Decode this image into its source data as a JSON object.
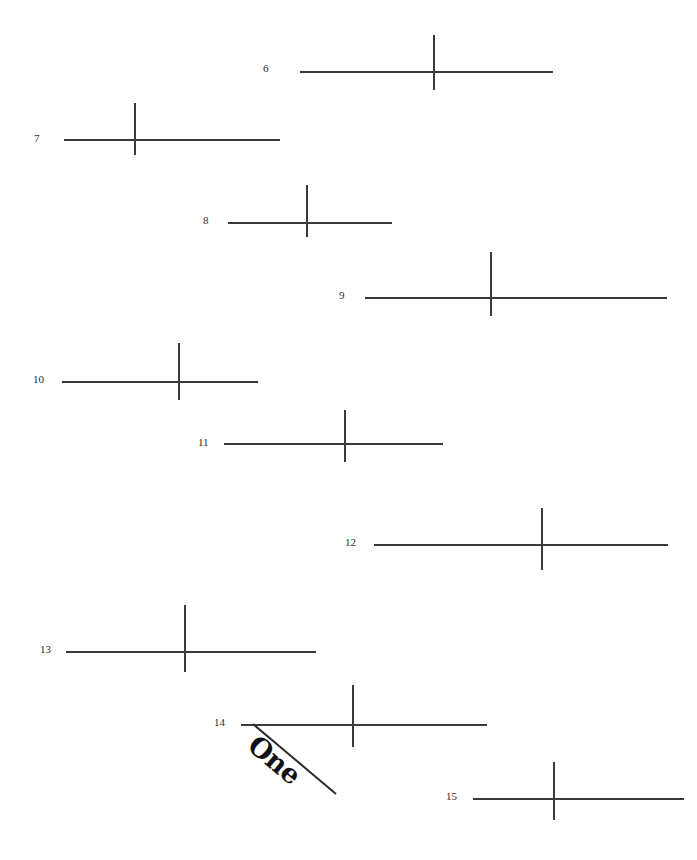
{
  "page": {
    "width": 697,
    "height": 860,
    "background_color": "#ffffff",
    "ink_color": "#3a3a3a",
    "label_color": "#2b2b2b"
  },
  "annotation": {
    "text": "One",
    "rotation_deg": 40,
    "x": 262,
    "y": 729,
    "color": "#111111"
  },
  "diagonal": {
    "x1": 253,
    "y1": 724,
    "x2": 336,
    "y2": 794,
    "color": "#2b2b2b",
    "width": 2
  },
  "crosses": [
    {
      "label": "6",
      "label_x": 263,
      "label_y": 63,
      "h_x": 300,
      "h_y": 71,
      "h_w": 253,
      "v_x": 433,
      "v_y": 35,
      "v_h": 55
    },
    {
      "label": "7",
      "label_x": 34,
      "label_y": 133,
      "h_x": 64,
      "h_y": 139,
      "h_w": 216,
      "v_x": 134,
      "v_y": 103,
      "v_h": 52
    },
    {
      "label": "8",
      "label_x": 203,
      "label_y": 215,
      "h_x": 228,
      "h_y": 222,
      "h_w": 164,
      "v_x": 306,
      "v_y": 185,
      "v_h": 52
    },
    {
      "label": "9",
      "label_x": 339,
      "label_y": 290,
      "h_x": 365,
      "h_y": 297,
      "h_w": 302,
      "v_x": 490,
      "v_y": 252,
      "v_h": 64
    },
    {
      "label": "10",
      "label_x": 33,
      "label_y": 374,
      "h_x": 62,
      "h_y": 381,
      "h_w": 196,
      "v_x": 178,
      "v_y": 343,
      "v_h": 57
    },
    {
      "label": "11",
      "label_x": 198,
      "label_y": 437,
      "h_x": 224,
      "h_y": 443,
      "h_w": 219,
      "v_x": 344,
      "v_y": 410,
      "v_h": 52
    },
    {
      "label": "12",
      "label_x": 345,
      "label_y": 537,
      "h_x": 374,
      "h_y": 544,
      "h_w": 294,
      "v_x": 541,
      "v_y": 508,
      "v_h": 62
    },
    {
      "label": "13",
      "label_x": 40,
      "label_y": 644,
      "h_x": 66,
      "h_y": 651,
      "h_w": 250,
      "v_x": 184,
      "v_y": 605,
      "v_h": 67
    },
    {
      "label": "14",
      "label_x": 214,
      "label_y": 717,
      "h_x": 241,
      "h_y": 724,
      "h_w": 246,
      "v_x": 352,
      "v_y": 685,
      "v_h": 62
    },
    {
      "label": "15",
      "label_x": 446,
      "label_y": 791,
      "h_x": 473,
      "h_y": 798,
      "h_w": 211,
      "v_x": 553,
      "v_y": 762,
      "v_h": 58
    }
  ]
}
